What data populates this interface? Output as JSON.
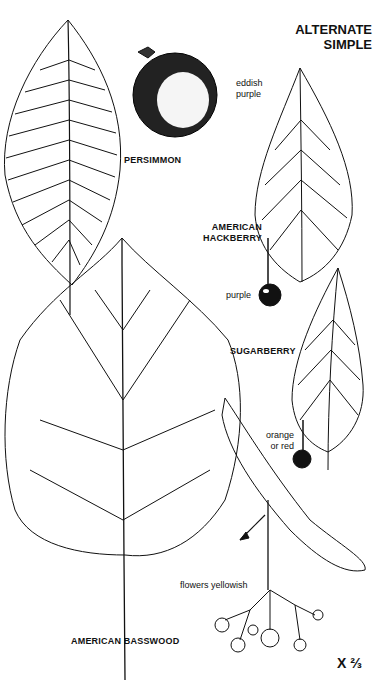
{
  "plate": {
    "title_line1": "ALTERNATE",
    "title_line2": "SIMPLE",
    "scale": "X ⅔"
  },
  "species": [
    {
      "name": "PERSIMMON",
      "fruit_note_line1": "eddish",
      "fruit_note_line2": "purple"
    },
    {
      "name_line1": "AMERICAN",
      "name_line2": "HACKBERRY",
      "fruit_note": "purple"
    },
    {
      "name": "SUGARBERRY",
      "fruit_note_line1": "orange",
      "fruit_note_line2": "or red"
    },
    {
      "name": "AMERICAN BASSWOOD",
      "flower_note": "flowers yellowish"
    }
  ],
  "colors": {
    "ink": "#111111",
    "background": "#ffffff"
  }
}
